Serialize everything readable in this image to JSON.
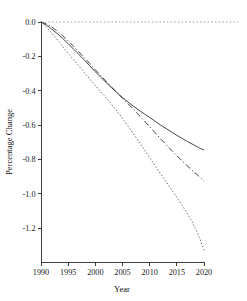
{
  "chart_data": {
    "type": "line",
    "title": "",
    "xlabel": "Year",
    "ylabel": "Percentage Change",
    "xlim": [
      1990,
      2020
    ],
    "ylim": [
      -1.35,
      0.04
    ],
    "grid": false,
    "legend": "none",
    "xticks": [
      1990,
      1995,
      2000,
      2005,
      2010,
      2015,
      2020
    ],
    "xtick_labels": [
      "1990",
      "1995",
      "2000",
      "2005",
      "2010",
      "2015",
      "2020"
    ],
    "yticks": [
      0.0,
      -0.2,
      -0.4,
      -0.6,
      -0.8,
      -1.0,
      -1.2
    ],
    "ytick_labels": [
      "0.0",
      "-0.2",
      "-0.4",
      "-0.6",
      "-0.8",
      "-1.0",
      "-1.2"
    ],
    "reference_lines": [
      {
        "name": "zero-line",
        "orientation": "horizontal",
        "value": 0.0,
        "style": "dotted"
      }
    ],
    "x": [
      1990,
      1991,
      1992,
      1993,
      1994,
      1995,
      1996,
      1997,
      1998,
      1999,
      2000,
      2001,
      2002,
      2003,
      2004,
      2005,
      2006,
      2007,
      2008,
      2009,
      2010,
      2011,
      2012,
      2013,
      2014,
      2015,
      2016,
      2017,
      2018,
      2019,
      2020
    ],
    "series": [
      {
        "name": "series-solid",
        "style": "solid",
        "values": [
          0.0,
          -0.018,
          -0.042,
          -0.068,
          -0.096,
          -0.126,
          -0.158,
          -0.19,
          -0.223,
          -0.256,
          -0.29,
          -0.322,
          -0.353,
          -0.383,
          -0.412,
          -0.44,
          -0.466,
          -0.49,
          -0.513,
          -0.535,
          -0.556,
          -0.578,
          -0.6,
          -0.62,
          -0.64,
          -0.66,
          -0.679,
          -0.697,
          -0.714,
          -0.731,
          -0.747
        ]
      },
      {
        "name": "series-dashdot",
        "style": "dash-dot",
        "values": [
          0.0,
          -0.012,
          -0.03,
          -0.053,
          -0.08,
          -0.11,
          -0.142,
          -0.175,
          -0.209,
          -0.243,
          -0.278,
          -0.312,
          -0.346,
          -0.379,
          -0.412,
          -0.444,
          -0.476,
          -0.508,
          -0.542,
          -0.576,
          -0.61,
          -0.645,
          -0.68,
          -0.713,
          -0.746,
          -0.778,
          -0.81,
          -0.84,
          -0.869,
          -0.897,
          -0.927
        ]
      },
      {
        "name": "series-dotted",
        "style": "dotted",
        "values": [
          0.0,
          -0.03,
          -0.066,
          -0.104,
          -0.143,
          -0.182,
          -0.22,
          -0.258,
          -0.296,
          -0.333,
          -0.37,
          -0.406,
          -0.442,
          -0.48,
          -0.52,
          -0.562,
          -0.606,
          -0.651,
          -0.697,
          -0.743,
          -0.79,
          -0.837,
          -0.884,
          -0.93,
          -0.976,
          -1.022,
          -1.07,
          -1.12,
          -1.175,
          -1.245,
          -1.33
        ]
      }
    ]
  },
  "figure": {
    "background_color": "#ffffff",
    "axis_color": "#2b2b2b"
  }
}
